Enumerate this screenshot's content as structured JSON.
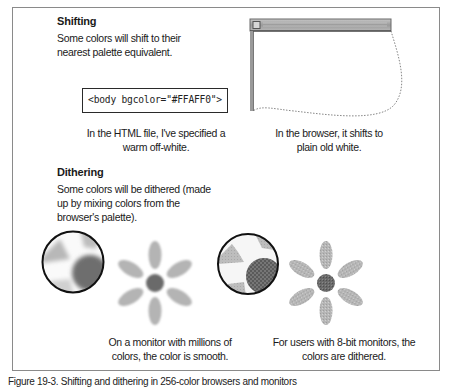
{
  "figure": {
    "sections": [
      {
        "id": "shifting",
        "heading": "Shifting",
        "description_lines": [
          "Some colors will shift to their",
          "nearest palette equivalent."
        ],
        "code_sample": "<body bgcolor=\"#FFAFF0\">",
        "left_caption_lines": [
          "In the HTML file, I've specified a",
          "warm off-white."
        ],
        "right_caption_lines": [
          "In the browser, it shifts to",
          "plain old white."
        ]
      },
      {
        "id": "dithering",
        "heading": "Dithering",
        "description_lines": [
          "Some colors will be dithered (made",
          "up by mixing colors from the",
          "browser's palette)."
        ],
        "left_caption_lines": [
          "On a monitor with millions of",
          "colors, the color is smooth."
        ],
        "right_caption_lines": [
          "For users with 8-bit monitors, the",
          "colors are dithered."
        ]
      }
    ],
    "figure_caption": "Figure 19-3. Shifting and dithering in 256-color browsers and monitors"
  },
  "illustrations": {
    "browser_window": {
      "icon": "browser-window-icon",
      "background": "#ffffff"
    },
    "smooth_magnifier": {
      "icon": "magnifier-icon"
    },
    "smooth_flower": {
      "icon": "flower-icon"
    },
    "dithered_magnifier": {
      "icon": "magnifier-icon"
    },
    "dithered_flower": {
      "icon": "flower-icon"
    }
  },
  "colors": {
    "petal": "#b4b4b4",
    "center": "#6a6a6a",
    "frame_border": "#8a8a8a",
    "titlebar": "#a9a9a9"
  }
}
